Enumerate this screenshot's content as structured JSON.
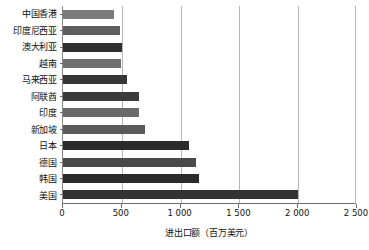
{
  "chart_data": {
    "type": "bar",
    "orientation": "horizontal",
    "title": "",
    "xlabel": "进出口额（百万美元）",
    "ylabel": "",
    "xlim": [
      0,
      2500
    ],
    "grid": true,
    "legend": null,
    "xticks": [
      "0",
      "500",
      "1 000",
      "1 500",
      "2 000",
      "2 500"
    ],
    "xtick_values": [
      0,
      500,
      1000,
      1500,
      2000,
      2500
    ],
    "categories": [
      "中国香港",
      "印度尼西亚",
      "澳大利亚",
      "越南",
      "马来西亚",
      "阿联酋",
      "印度",
      "新加坡",
      "日本",
      "德国",
      "韩国",
      "美国"
    ],
    "values": [
      430,
      485,
      500,
      490,
      540,
      650,
      650,
      700,
      1070,
      1130,
      1160,
      2000
    ],
    "bar_colors": [
      "#7b7b7b",
      "#5e5e5e",
      "#2f2f2f",
      "#6f6f6f",
      "#363636",
      "#3b3b3b",
      "#6a6a6a",
      "#5a5a5a",
      "#2b2b2b",
      "#4a4a4a",
      "#2b2b2b",
      "#333333"
    ]
  },
  "colors": {
    "axis": "#6e6e6e",
    "gridline": "#b5b5b5",
    "background": "#ffffff",
    "text": "#111111"
  }
}
